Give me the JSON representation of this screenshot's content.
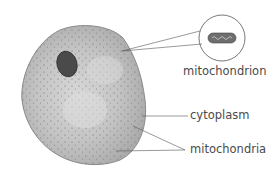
{
  "diagram": {
    "labels": {
      "mitochondrion": "mitochondrion",
      "cytoplasm": "cytoplasm",
      "mitochondria": "mitochondria"
    },
    "colors": {
      "cell_fill": "#b8b8b8",
      "cell_edge": "#8a8a8a",
      "nucleus": "#4a4a4a",
      "leader_line": "#555555",
      "text": "#4a4a4a"
    }
  }
}
